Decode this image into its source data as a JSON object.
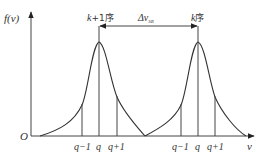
{
  "diagram": {
    "y_axis_label": "f(ν)",
    "x_axis_label": "ν",
    "origin_label": "O",
    "peak_left_label_k": "k",
    "peak_left_label_rest": "+1序",
    "peak_right_label_k": "k",
    "peak_right_label_rest": "序",
    "spacing_label": "Δν",
    "spacing_subscript": "SR",
    "left_ticks": [
      "q−1",
      "q",
      "q+1"
    ],
    "right_ticks": [
      "q−1",
      "q",
      "q+1"
    ]
  },
  "colors": {
    "line": "#444444",
    "text": "#333333",
    "background": "#ffffff"
  }
}
